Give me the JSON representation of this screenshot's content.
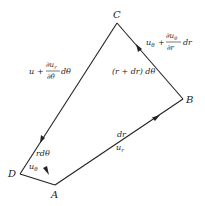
{
  "diagram": {
    "vertices": {
      "A": {
        "label": "A",
        "x": 55,
        "y": 185
      },
      "B": {
        "label": "B",
        "x": 183,
        "y": 99
      },
      "C": {
        "label": "C",
        "x": 117,
        "y": 23
      },
      "D": {
        "label": "D",
        "x": 20,
        "y": 174
      }
    },
    "edges": {
      "AB": {
        "length_label": "dr",
        "velocity_label": "u",
        "velocity_sub": "r"
      },
      "BC": {
        "length_label": "(r + dr) dθ",
        "velocity_label": "u",
        "velocity_sub": "θ",
        "plus": "+",
        "frac_num": "∂u",
        "frac_num_sub": "θ",
        "frac_den": "∂r",
        "suffix": "dr"
      },
      "CD": {
        "velocity_label": "u",
        "plus": "+",
        "frac_num": "∂u",
        "frac_num_sub": "r",
        "frac_den": "∂θ",
        "suffix": "dθ"
      },
      "DA": {
        "length_label": "rdθ",
        "velocity_label": "u",
        "velocity_sub": "θ"
      }
    },
    "color": "#222222"
  }
}
